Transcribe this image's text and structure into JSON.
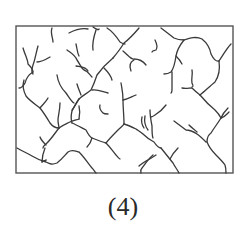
{
  "figure": {
    "caption": "(4)",
    "stroke_color": "#3a3a3a",
    "frame": {
      "x": 16,
      "y": 26,
      "width": 217,
      "height": 147
    },
    "streams": [
      "M52,28 C50,33 53,38 53,42",
      "M69,33 C75,30 82,28 88,29",
      "M93,27 C97,30 99,30 99,29",
      "M96,30 C94,36 92,44 93,50",
      "M107,28 C112,31 116,36 120,42 C123,44 125,44 125,44",
      "M139,28 C134,34 128,40 124,43 C121,48 118,52 113,58",
      "M67,50 C71,53 75,55 77,60 C80,64 81,68 84,70 C88,71 89,74 92,77",
      "M76,44 C77,48 77,52 79,56",
      "M76,66 C81,67 86,67 88,71",
      "M113,58 C107,63 102,68 97,75 C95,81 93,86 91,90 C86,94 82,96 79,99",
      "M104,68 C108,72 111,76 112,80",
      "M123,51 C128,55 131,60 134,59 C138,59 143,61 146,65",
      "M134,60 C130,62 129,66 131,71",
      "M23,48 C25,55 28,60 28,64 C31,67 33,70 33,72",
      "M38,46 C36,53 35,60 33,65 C32,68 31,72 33,74",
      "M50,57 C45,60 40,62 37,62",
      "M33,72 C28,75 26,79 25,83 C23,86 22,88 19,88",
      "M24,80 C22,86 24,92 26,96 C30,101 35,104 40,108 C44,113 47,118 50,123 C53,127 56,128 59,128",
      "M40,108 C43,104 46,102 48,98",
      "M57,75 C58,82 62,89 66,93 C69,97 71,101 74,103",
      "M79,99 C76,103 74,107 72,111 C71,115 71,120 72,123",
      "M77,84 C78,88 80,92 81,95",
      "M92,90 C98,89 103,92 108,93",
      "M60,103 C60,110 58,116 58,120 C58,124 59,126 59,128",
      "M59,128 C63,125 66,124 70,122 C74,120 77,120 79,119",
      "M79,99 C76,104 74,108 72,110",
      "M59,128 C55,133 52,138 47,143 C44,146 43,146 43,148",
      "M40,137 C41,140 44,143 46,145",
      "M45,148 C43,153 42,158 42,162",
      "M42,162 C45,160 47,160 46,160",
      "M17,148 C22,151 27,153 32,156 C37,159 42,161 46,162 C50,164 52,165 57,163 C62,159 65,155 68,152 C72,149 75,151 79,152 C84,157 88,163 92,168 C94,170 95,172 96,173",
      "M72,123 C77,125 82,128 86,130 C88,134 90,137 92,138 C97,140 102,142 106,143 C110,147 112,150 116,155 C118,157 118,158 120,159",
      "M92,138 C91,142 89,145 87,147",
      "M79,119 C80,114 80,110 79,106",
      "M100,105 C99,108 101,111 103,113 C104,114 107,114 108,114",
      "M106,143 C110,138 114,134 118,130 C121,127 123,126 124,124",
      "M124,124 C124,116 123,108 123,100 C123,93 122,89 121,83",
      "M123,100 C128,99 131,97 136,95",
      "M124,124 C128,125 132,127 136,129 C139,131 141,132 143,134 C146,137 150,140 154,142 C156,145 158,148 161,148",
      "M142,117 C141,121 142,125 144,128",
      "M145,116 C144,121 145,126 148,130",
      "M150,110 C150,116 151,121 152,126 C152,131 152,136 153,138",
      "M166,105 C163,109 160,112 155,115 C152,117 152,117 151,117",
      "M161,148 C165,153 169,158 173,163 C175,167 177,169 179,173",
      "M156,155 C153,157 150,159 146,161 C143,163 140,165 139,166",
      "M153,155 C149,158 145,164 142,168 C140,170 141,172 141,173",
      "M170,159 C172,155 175,151 178,148",
      "M161,28 C165,31 170,35 174,38 C178,40 181,40 184,40",
      "M155,40 C157,44 158,47 156,50 C154,51 153,50 152,52",
      "M184,40 C190,38 196,36 202,39 C207,43 210,48 211,54 C213,58 216,62 219,61",
      "M184,40 C180,45 177,50 176,56 C175,63 174,68 171,72 C168,74 166,74 164,74",
      "M176,56 C178,58 180,60 182,64",
      "M172,72 C172,78 172,84 172,89 C172,93 171,93 171,93",
      "M219,61 C223,55 227,48 231,44",
      "M219,61 C220,68 219,76 215,82 C210,86 205,91 200,95",
      "M192,70 C193,75 191,78 192,83 C193,86 194,86 192,87",
      "M182,88 C186,89 189,88 192,88 C194,90 196,92 200,95",
      "M200,95 C205,101 210,106 215,110 C218,113 220,116 221,118",
      "M221,118 C223,113 226,110 228,108",
      "M221,118 C225,117 227,114 229,112",
      "M221,118 C218,123 214,128 211,133 C208,135 207,138 207,142",
      "M174,121 C178,124 182,127 186,130 C191,130 194,132 197,134 C200,136 203,139 206,142",
      "M189,125 C192,128 195,130 197,132",
      "M207,142 C209,147 212,151 216,155 C220,159 223,162 225,165 C226,168 226,171 226,173"
    ]
  }
}
